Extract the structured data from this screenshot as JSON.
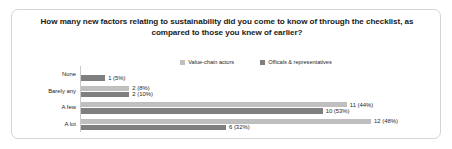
{
  "chart_data": {
    "type": "bar",
    "orientation": "horizontal",
    "title": "How many new factors relating to sustainability did you come to know of through the checklist, as compared to those you knew of earlier?",
    "xlabel": "",
    "ylabel": "",
    "grid": false,
    "legend_position": "top-center",
    "categories": [
      "None",
      "Barely any",
      "A few",
      "A lot"
    ],
    "series": [
      {
        "name": "Value-chain actors",
        "color": "#bfbfbf",
        "values": [
          null,
          2,
          11,
          12
        ],
        "percents": [
          null,
          8,
          44,
          48
        ],
        "labels": [
          "",
          "2 (8%)",
          "11 (44%)",
          "12 (48%)"
        ]
      },
      {
        "name": "Officals & representatives",
        "color": "#7f7f7f",
        "values": [
          1,
          2,
          10,
          6
        ],
        "percents": [
          5,
          10,
          53,
          32
        ],
        "labels": [
          "1 (5%)",
          "2 (10%)",
          "10 (53%)",
          "6 (32%)"
        ]
      }
    ],
    "xlim": [
      0,
      12
    ],
    "max_value": 12
  },
  "legend": {
    "items": [
      {
        "label": "Value-chain actors",
        "color": "#bfbfbf"
      },
      {
        "label": "Officals & representatives",
        "color": "#7f7f7f"
      }
    ]
  },
  "colors": {
    "series_a": "#bfbfbf",
    "series_b": "#7f7f7f",
    "frame": "#d4d4d4",
    "text": "#262626",
    "axis": "#c9c9c9"
  }
}
